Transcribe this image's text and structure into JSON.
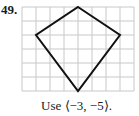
{
  "problem": {
    "number": "49.",
    "caption": "Use ⟨−3, −5⟩."
  },
  "diagram": {
    "grid": {
      "cols": 8,
      "rows": 6,
      "origin_px": [
        22,
        7
      ],
      "cell_px": 14,
      "line_color": "#c8c8c8"
    },
    "shape": "kite",
    "vertices_grid": [
      [
        4,
        0
      ],
      [
        7,
        2
      ],
      [
        4,
        6
      ],
      [
        1,
        2
      ]
    ],
    "stroke_color": "#111111"
  }
}
